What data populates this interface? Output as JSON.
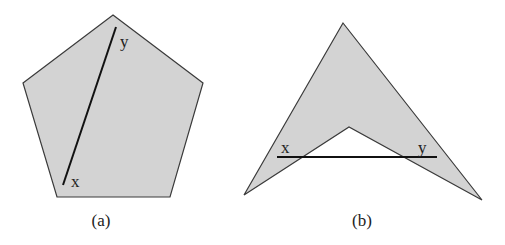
{
  "figures": [
    {
      "id": "a",
      "caption": "(a)",
      "shape": "convex pentagon",
      "fill_color": "#d3d3d3",
      "segment": {
        "endpoint_start_label": "x",
        "endpoint_end_label": "y"
      }
    },
    {
      "id": "b",
      "caption": "(b)",
      "shape": "non-convex arrowhead (chevron)",
      "fill_color": "#d3d3d3",
      "segment": {
        "endpoint_start_label": "x",
        "endpoint_end_label": "y"
      }
    }
  ]
}
